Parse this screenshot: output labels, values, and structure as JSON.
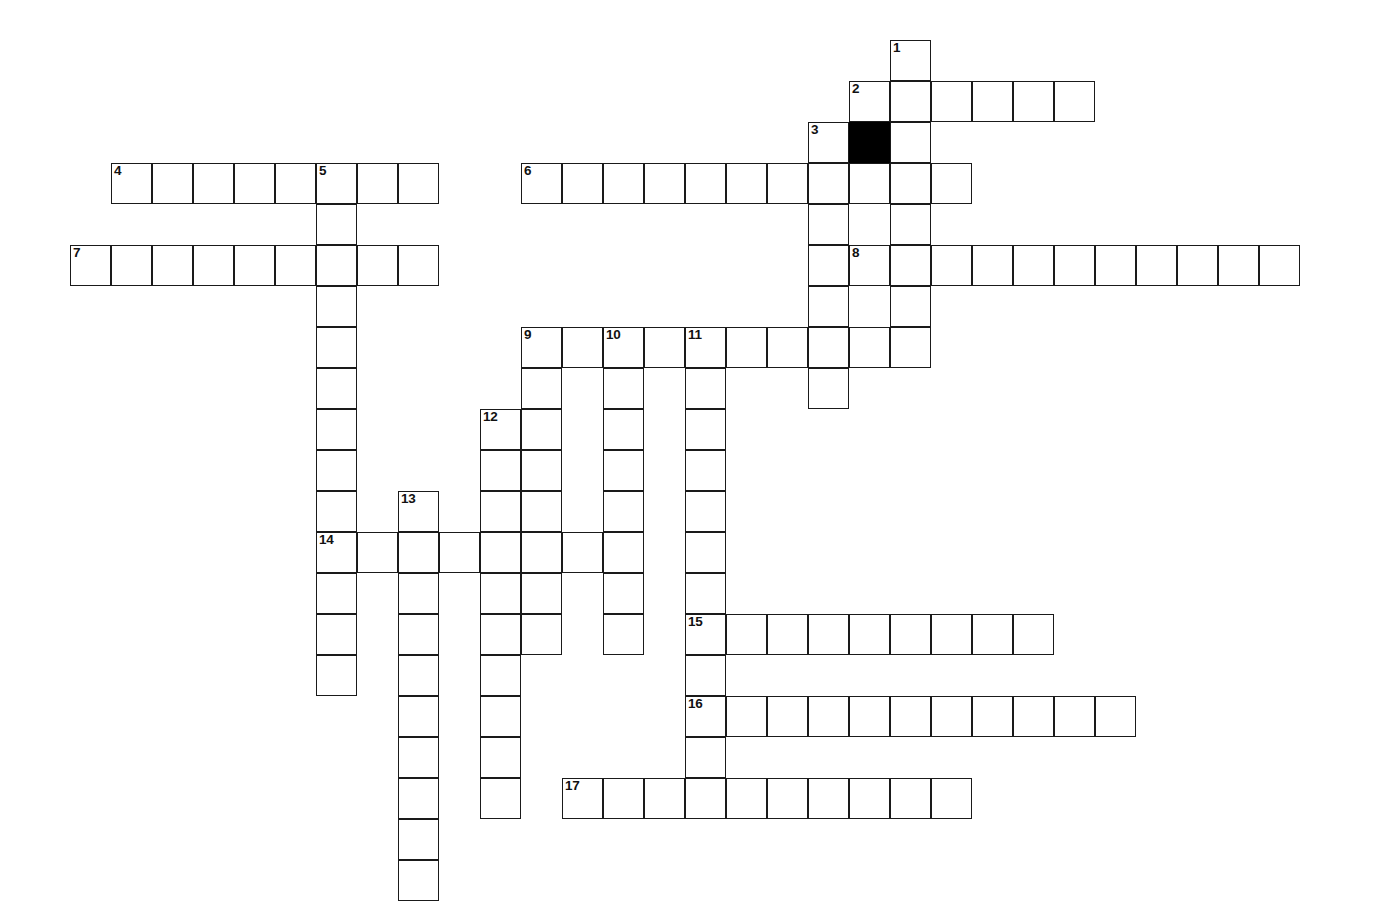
{
  "puzzle": {
    "kind": "crossword-grid",
    "title": "Crossword Puzzle Grid",
    "cell_size_px": 41,
    "origin_x_px": 70,
    "origin_y_px": 40,
    "columns": 32,
    "rows": 21,
    "background_color": "#ffffff",
    "cell_fill_color": "#ffffff",
    "block_fill_color": "#000000",
    "border_color": "#1a1a1a",
    "number_color": "#111111",
    "clue_count": 17,
    "block_cells": [
      {
        "col": 19,
        "row": 2
      }
    ],
    "entries": [
      {
        "number": "1",
        "direction": "down",
        "col": 20,
        "row": 0,
        "length": 8
      },
      {
        "number": "2",
        "direction": "across",
        "col": 19,
        "row": 1,
        "length": 6
      },
      {
        "number": "3",
        "direction": "down",
        "col": 18,
        "row": 2,
        "length": 7
      },
      {
        "number": "4",
        "direction": "across",
        "col": 1,
        "row": 3,
        "length": 8
      },
      {
        "number": "5",
        "direction": "down",
        "col": 6,
        "row": 3,
        "length": 13
      },
      {
        "number": "6",
        "direction": "across",
        "col": 11,
        "row": 3,
        "length": 11
      },
      {
        "number": "7",
        "direction": "across",
        "col": 0,
        "row": 5,
        "length": 9
      },
      {
        "number": "8",
        "direction": "across",
        "col": 19,
        "row": 5,
        "length": 11
      },
      {
        "number": "9",
        "direction": "down",
        "col": 11,
        "row": 7,
        "length": 8
      },
      {
        "number": "9",
        "direction": "across",
        "col": 11,
        "row": 7,
        "length": 9
      },
      {
        "number": "10",
        "direction": "down",
        "col": 13,
        "row": 7,
        "length": 8
      },
      {
        "number": "11",
        "direction": "down",
        "col": 15,
        "row": 7,
        "length": 11
      },
      {
        "number": "12",
        "direction": "down",
        "col": 10,
        "row": 9,
        "length": 10
      },
      {
        "number": "13",
        "direction": "down",
        "col": 8,
        "row": 11,
        "length": 10
      },
      {
        "number": "14",
        "direction": "across",
        "col": 6,
        "row": 12,
        "length": 7
      },
      {
        "number": "15",
        "direction": "across",
        "col": 15,
        "row": 14,
        "length": 9
      },
      {
        "number": "16",
        "direction": "across",
        "col": 15,
        "row": 16,
        "length": 11
      },
      {
        "number": "17",
        "direction": "across",
        "col": 12,
        "row": 18,
        "length": 10
      }
    ],
    "numbered_cells": [
      {
        "number": "1",
        "col": 20,
        "row": 0
      },
      {
        "number": "2",
        "col": 19,
        "row": 1
      },
      {
        "number": "3",
        "col": 18,
        "row": 2
      },
      {
        "number": "4",
        "col": 1,
        "row": 3
      },
      {
        "number": "5",
        "col": 6,
        "row": 3
      },
      {
        "number": "6",
        "col": 11,
        "row": 3
      },
      {
        "number": "7",
        "col": 0,
        "row": 5
      },
      {
        "number": "8",
        "col": 19,
        "row": 5
      },
      {
        "number": "9",
        "col": 11,
        "row": 7
      },
      {
        "number": "10",
        "col": 13,
        "row": 7
      },
      {
        "number": "11",
        "col": 15,
        "row": 7
      },
      {
        "number": "12",
        "col": 10,
        "row": 9
      },
      {
        "number": "13",
        "col": 8,
        "row": 11
      },
      {
        "number": "14",
        "col": 6,
        "row": 12
      },
      {
        "number": "15",
        "col": 15,
        "row": 14
      },
      {
        "number": "16",
        "col": 15,
        "row": 16
      },
      {
        "number": "17",
        "col": 12,
        "row": 18
      }
    ]
  }
}
